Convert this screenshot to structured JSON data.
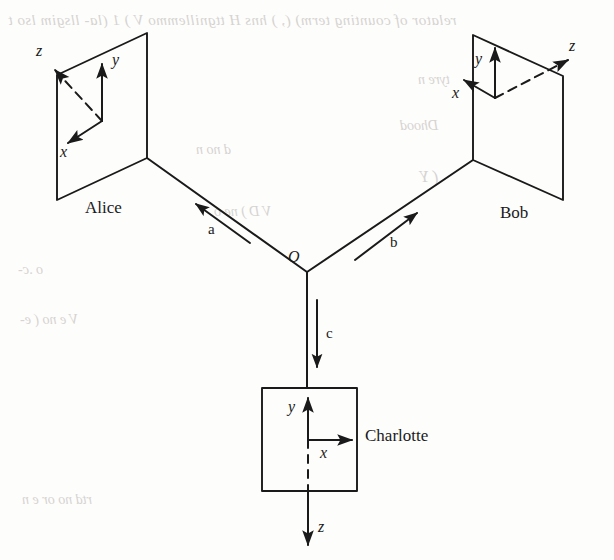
{
  "figure": {
    "width": 614,
    "height": 560,
    "background_color": "#fdfdfc",
    "ink_color": "#1a1a1a",
    "bleed_color": "#c9c6c2"
  },
  "observers": {
    "alice": {
      "name": "Alice",
      "panel_shape": "parallelogram",
      "axes": {
        "x": {
          "label": "x",
          "style": "solid",
          "direction": "down-left"
        },
        "y": {
          "label": "y",
          "style": "solid",
          "direction": "up"
        },
        "z": {
          "label": "z",
          "style": "dashed",
          "direction": "up-left"
        }
      }
    },
    "bob": {
      "name": "Bob",
      "panel_shape": "parallelogram",
      "axes": {
        "x": {
          "label": "x",
          "style": "solid",
          "direction": "up-left"
        },
        "y": {
          "label": "y",
          "style": "solid",
          "direction": "up"
        },
        "z": {
          "label": "z",
          "style": "dashed",
          "direction": "up-right"
        }
      }
    },
    "charlotte": {
      "name": "Charlotte",
      "panel_shape": "square",
      "axes": {
        "x": {
          "label": "x",
          "style": "solid",
          "direction": "right"
        },
        "y": {
          "label": "y",
          "style": "solid",
          "direction": "up"
        },
        "z": {
          "label": "z",
          "style": "dashed-then-solid",
          "direction": "down"
        }
      }
    }
  },
  "source": {
    "label": "O",
    "description": "common origin vertex from which the three particle rays emanate"
  },
  "rays": {
    "a": {
      "label": "a",
      "from": "O",
      "to": "Alice",
      "direction": "up-left"
    },
    "b": {
      "label": "b",
      "from": "O",
      "to": "Bob",
      "direction": "up-right"
    },
    "c": {
      "label": "c",
      "from": "O",
      "to": "Charlotte",
      "direction": "down"
    }
  },
  "bleed_text": {
    "line1": "relator of counting term)  (, ) hns H ttgnillemmo V ) 1 (la-  llsgim lso t",
    "line2": "tyre  n",
    "line3": "Dhood",
    "line4": "( Y",
    "line5": "d  no   n",
    "line6": "V D  ) ne  o",
    "line7": "o  .c-",
    "line8": "V  e   no  ( e-",
    "line9": "rtd   no   or   e  n"
  }
}
